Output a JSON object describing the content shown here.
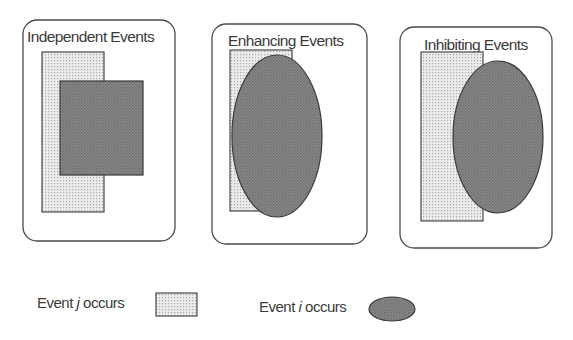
{
  "figure": {
    "panels": [
      {
        "title": "Independent Events",
        "box": {
          "x": 23,
          "y": 20,
          "w": 152,
          "h": 221
        },
        "event_j_rect": {
          "x": 42,
          "y": 52,
          "w": 62,
          "h": 160
        },
        "event_i_shape": {
          "type": "rect",
          "x": 60,
          "y": 81,
          "w": 83,
          "h": 94
        }
      },
      {
        "title": "Enhancing Events",
        "box": {
          "x": 212,
          "y": 24,
          "w": 155,
          "h": 220
        },
        "event_j_rect": {
          "x": 230,
          "y": 50,
          "w": 62,
          "h": 161
        },
        "event_i_shape": {
          "type": "ellipse",
          "cx": 277,
          "cy": 136,
          "rx": 45,
          "ry": 81
        }
      },
      {
        "title": "Inhibiting Events",
        "box": {
          "x": 400,
          "y": 27,
          "w": 152,
          "h": 221
        },
        "event_j_rect": {
          "x": 421,
          "y": 52,
          "w": 62,
          "h": 169
        },
        "event_i_shape": {
          "type": "ellipse",
          "cx": 498,
          "cy": 137,
          "rx": 45,
          "ry": 76
        }
      }
    ],
    "legend": {
      "event_j": {
        "prefix": "Event ",
        "var": "j",
        "suffix": " occurs"
      },
      "event_i": {
        "prefix": "Event ",
        "var": "i",
        "suffix": " occurs"
      }
    },
    "colors": {
      "light_fill": "#dcdcdc",
      "dark_fill": "#8a8a8a",
      "stroke": "#4a4a4a"
    }
  }
}
